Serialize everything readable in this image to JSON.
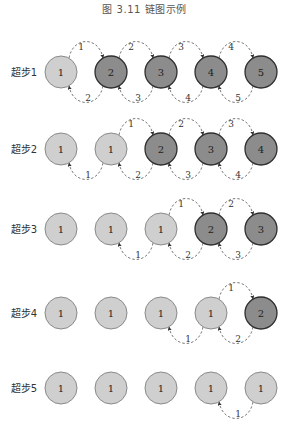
{
  "title": "图 3.11   链图示例",
  "colors": {
    "light_fill": "#cfcfcf",
    "light_stroke": "#8a8a8a",
    "dark_fill": "#8c8c8c",
    "dark_stroke": "#2e2e2e",
    "arc": "#555555",
    "text": "#333333"
  },
  "layout": {
    "circle_x": [
      61,
      111,
      161,
      211,
      261
    ],
    "radius": 16,
    "label_x": 24
  },
  "rows": [
    {
      "label": "超步1",
      "y": 72,
      "nodes": [
        {
          "value": "1",
          "active": false
        },
        {
          "value": "2",
          "active": true
        },
        {
          "value": "3",
          "active": true
        },
        {
          "value": "4",
          "active": true
        },
        {
          "value": "5",
          "active": true
        }
      ],
      "top_arcs": [
        {
          "from": 0,
          "to": 1,
          "label": "1"
        },
        {
          "from": 1,
          "to": 2,
          "label": "2"
        },
        {
          "from": 2,
          "to": 3,
          "label": "3"
        },
        {
          "from": 3,
          "to": 4,
          "label": "4"
        }
      ],
      "bottom_arcs": [
        {
          "from": 1,
          "to": 0,
          "label": "2"
        },
        {
          "from": 2,
          "to": 1,
          "label": "3"
        },
        {
          "from": 3,
          "to": 2,
          "label": "4"
        },
        {
          "from": 4,
          "to": 3,
          "label": "5"
        }
      ]
    },
    {
      "label": "超步2",
      "y": 149,
      "nodes": [
        {
          "value": "1",
          "active": false
        },
        {
          "value": "1",
          "active": false
        },
        {
          "value": "2",
          "active": true
        },
        {
          "value": "3",
          "active": true
        },
        {
          "value": "4",
          "active": true
        }
      ],
      "top_arcs": [
        {
          "from": 1,
          "to": 2,
          "label": "1"
        },
        {
          "from": 2,
          "to": 3,
          "label": "2"
        },
        {
          "from": 3,
          "to": 4,
          "label": "3"
        }
      ],
      "bottom_arcs": [
        {
          "from": 1,
          "to": 0,
          "label": "1"
        },
        {
          "from": 2,
          "to": 1,
          "label": "2"
        },
        {
          "from": 3,
          "to": 2,
          "label": "3"
        },
        {
          "from": 4,
          "to": 3,
          "label": "4"
        }
      ]
    },
    {
      "label": "超步3",
      "y": 229,
      "nodes": [
        {
          "value": "1",
          "active": false
        },
        {
          "value": "1",
          "active": false
        },
        {
          "value": "1",
          "active": false
        },
        {
          "value": "2",
          "active": true
        },
        {
          "value": "3",
          "active": true
        }
      ],
      "top_arcs": [
        {
          "from": 2,
          "to": 3,
          "label": "1"
        },
        {
          "from": 3,
          "to": 4,
          "label": "2"
        }
      ],
      "bottom_arcs": [
        {
          "from": 2,
          "to": 1,
          "label": "1"
        },
        {
          "from": 3,
          "to": 2,
          "label": "2"
        },
        {
          "from": 4,
          "to": 3,
          "label": "3"
        }
      ]
    },
    {
      "label": "超步4",
      "y": 313,
      "nodes": [
        {
          "value": "1",
          "active": false
        },
        {
          "value": "1",
          "active": false
        },
        {
          "value": "1",
          "active": false
        },
        {
          "value": "1",
          "active": false
        },
        {
          "value": "2",
          "active": true
        }
      ],
      "top_arcs": [
        {
          "from": 3,
          "to": 4,
          "label": "1"
        }
      ],
      "bottom_arcs": [
        {
          "from": 3,
          "to": 2,
          "label": "1"
        },
        {
          "from": 4,
          "to": 3,
          "label": "2"
        }
      ]
    },
    {
      "label": "超步5",
      "y": 388,
      "nodes": [
        {
          "value": "1",
          "active": false
        },
        {
          "value": "1",
          "active": false
        },
        {
          "value": "1",
          "active": false
        },
        {
          "value": "1",
          "active": false
        },
        {
          "value": "1",
          "active": false
        }
      ],
      "top_arcs": [],
      "bottom_arcs": [
        {
          "from": 4,
          "to": 3,
          "label": "1"
        }
      ]
    }
  ]
}
